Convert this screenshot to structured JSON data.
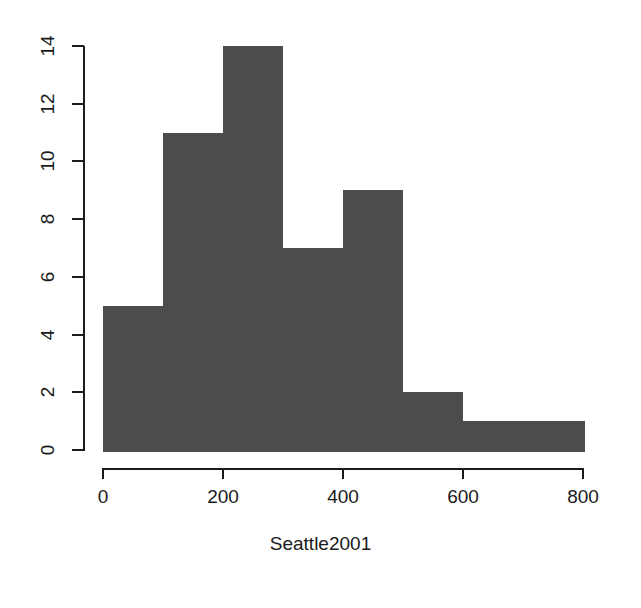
{
  "chart_data": {
    "type": "bar",
    "title": "",
    "subtitle": "",
    "xlabel": "Seattle2001",
    "ylabel": "",
    "bin_width": 100,
    "bin_edges": [
      0,
      100,
      200,
      300,
      400,
      500,
      600,
      700,
      800
    ],
    "categories": [
      "0-100",
      "100-200",
      "200-300",
      "300-400",
      "400-500",
      "500-600",
      "600-700",
      "700-800"
    ],
    "values": [
      5,
      11,
      14,
      7,
      9,
      2,
      1,
      1
    ],
    "xlim": [
      0,
      800
    ],
    "ylim": [
      0,
      14
    ],
    "x_ticks": [
      0,
      200,
      400,
      600,
      800
    ],
    "x_tick_labels": [
      "0",
      "200",
      "400",
      "600",
      "800"
    ],
    "y_ticks": [
      0,
      2,
      4,
      6,
      8,
      10,
      12,
      14
    ],
    "y_tick_labels": [
      "0",
      "2",
      "4",
      "6",
      "8",
      "10",
      "12",
      "14"
    ],
    "grid": false,
    "legend": false,
    "bar_color": "#4c4c4c",
    "bar_border_color": "#ffffff",
    "axis_color": "#1c1c1c",
    "background": "#ffffff"
  },
  "axis_title": {
    "x": "Seattle2001"
  }
}
